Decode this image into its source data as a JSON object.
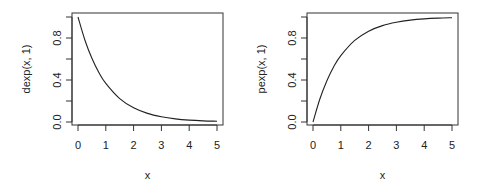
{
  "chart_data": [
    {
      "type": "line",
      "title": "",
      "xlabel": "x",
      "ylabel": "dexp(x, 1)",
      "xlim": [
        0,
        5
      ],
      "ylim": [
        0,
        1
      ],
      "x_ticks": [
        0,
        1,
        2,
        3,
        4,
        5
      ],
      "y_ticks": [
        0.0,
        0.2,
        0.4,
        0.6,
        0.8,
        1.0
      ],
      "y_tick_labels": [
        "0.0",
        "",
        "0.4",
        "",
        "0.8",
        ""
      ],
      "grid": false,
      "legend": null,
      "series": [
        {
          "name": "dexp(x, 1)",
          "x": [
            0,
            0.25,
            0.5,
            0.75,
            1,
            1.5,
            2,
            2.5,
            3,
            3.5,
            4,
            4.5,
            5
          ],
          "values": [
            1.0,
            0.779,
            0.607,
            0.472,
            0.368,
            0.223,
            0.135,
            0.082,
            0.05,
            0.03,
            0.018,
            0.011,
            0.007
          ]
        }
      ]
    },
    {
      "type": "line",
      "title": "",
      "xlabel": "x",
      "ylabel": "pexp(x, 1)",
      "xlim": [
        0,
        5
      ],
      "ylim": [
        0,
        1
      ],
      "x_ticks": [
        0,
        1,
        2,
        3,
        4,
        5
      ],
      "y_ticks": [
        0.0,
        0.2,
        0.4,
        0.6,
        0.8,
        1.0
      ],
      "y_tick_labels": [
        "0.0",
        "",
        "0.4",
        "",
        "0.8",
        ""
      ],
      "grid": false,
      "legend": null,
      "series": [
        {
          "name": "pexp(x, 1)",
          "x": [
            0,
            0.25,
            0.5,
            0.75,
            1,
            1.5,
            2,
            2.5,
            3,
            3.5,
            4,
            4.5,
            5
          ],
          "values": [
            0.0,
            0.221,
            0.393,
            0.528,
            0.632,
            0.777,
            0.865,
            0.918,
            0.95,
            0.97,
            0.982,
            0.989,
            0.993
          ]
        }
      ]
    }
  ],
  "panels": [
    {
      "ylabel": "dexp(x, 1)",
      "xlabel": "x",
      "x_tick_labels": [
        "0",
        "1",
        "2",
        "3",
        "4",
        "5"
      ],
      "y_tick_labels": [
        "0.0",
        "0.4",
        "0.8"
      ]
    },
    {
      "ylabel": "pexp(x, 1)",
      "xlabel": "x",
      "x_tick_labels": [
        "0",
        "1",
        "2",
        "3",
        "4",
        "5"
      ],
      "y_tick_labels": [
        "0.0",
        "0.4",
        "0.8"
      ]
    }
  ],
  "colors": {
    "line": "#222222",
    "axis": "#333333",
    "background": "#ffffff"
  }
}
